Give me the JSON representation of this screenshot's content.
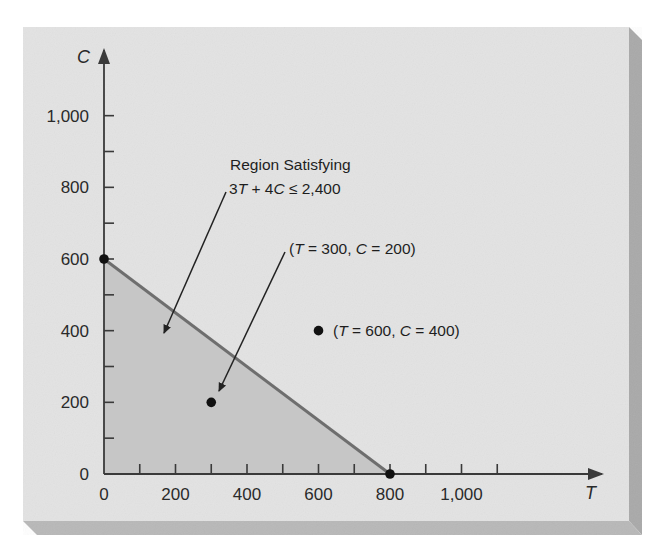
{
  "chart_data": {
    "type": "area",
    "title": "",
    "xlabel": "T",
    "ylabel": "C",
    "xlim": [
      0,
      1300
    ],
    "ylim": [
      0,
      1190
    ],
    "x_ticks": [
      0,
      200,
      400,
      600,
      800,
      1000
    ],
    "x_tick_labels": [
      "0",
      "200",
      "400",
      "600",
      "800",
      "1,000"
    ],
    "x_minor_ticks": [
      100,
      300,
      500,
      700,
      900,
      1100
    ],
    "y_ticks": [
      0,
      200,
      400,
      600,
      800,
      1000
    ],
    "y_tick_labels": [
      "0",
      "200",
      "400",
      "600",
      "800",
      "1,000"
    ],
    "y_minor_ticks": [
      100,
      300,
      500,
      700,
      900
    ],
    "grid": false,
    "constraint": {
      "expression": "3T + 4C ≤ 2,400",
      "boundary_line": [
        [
          0,
          600
        ],
        [
          800,
          0
        ]
      ],
      "feasible_region": [
        [
          0,
          0
        ],
        [
          0,
          600
        ],
        [
          800,
          0
        ]
      ]
    },
    "points": [
      {
        "T": 0,
        "C": 600,
        "label": ""
      },
      {
        "T": 800,
        "C": 0,
        "label": ""
      },
      {
        "T": 300,
        "C": 200,
        "label": "(T = 300, C = 200)"
      },
      {
        "T": 600,
        "C": 400,
        "label": "(T = 600, C = 400)"
      }
    ],
    "annotations": [
      {
        "text_line1": "Region Satisfying",
        "text_line2": "3T + 4C ≤ 2,400",
        "points_to": [
          165,
          330
        ]
      },
      {
        "text": "(T = 300, C = 200)",
        "points_to": [
          300,
          200
        ]
      },
      {
        "text": "(T = 600, C = 400)",
        "attached_to": [
          600,
          400
        ]
      }
    ]
  },
  "labels": {
    "x_axis": "T",
    "y_axis": "C",
    "region_line1": "Region Satisfying",
    "region_line2_a": "3",
    "region_line2_T": "T",
    "region_line2_b": " + 4",
    "region_line2_C": "C",
    "region_line2_c": " ≤ 2,400",
    "p1_open": "(",
    "p1_T": "T",
    "p1_mid": " = 300, ",
    "p1_C": "C",
    "p1_close": " = 200)",
    "p2_open": "(",
    "p2_T": "T",
    "p2_mid": " = 600, ",
    "p2_C": "C",
    "p2_close": " = 400)"
  },
  "colors": {
    "panel": "#e3e3e3",
    "panel_bevel": "#b4b4b4",
    "region_fill": "#c6c6c6",
    "boundary_line": "#6e6e6e",
    "axis": "#3a3a3a",
    "point": "#111111"
  }
}
